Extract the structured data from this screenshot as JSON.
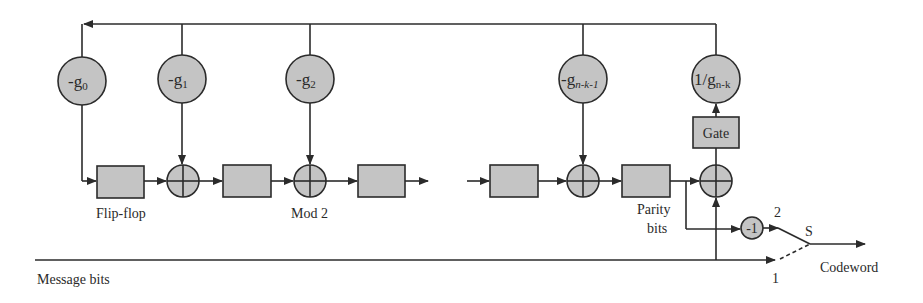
{
  "diagram": {
    "colors": {
      "fill": "#c4c4c4",
      "stroke": "#2b2b2b",
      "background": "#ffffff"
    },
    "coefficients": [
      {
        "id": "g0",
        "prefix": "-g",
        "sub": "0"
      },
      {
        "id": "g1",
        "prefix": "-g",
        "sub": "1"
      },
      {
        "id": "g2",
        "prefix": "-g",
        "sub": "2"
      },
      {
        "id": "gnk1",
        "prefix": "-g",
        "sub": "n-k-1"
      },
      {
        "id": "gnk",
        "prefix": "1/g",
        "sub": "n-k"
      }
    ],
    "gate_label": "Gate",
    "labels": {
      "flip_flop": "Flip-flop",
      "mod2": "Mod 2",
      "parity_line1": "Parity",
      "parity_line2": "bits",
      "message_bits": "Message bits",
      "codeword": "Codeword",
      "switch": "S",
      "switch_pos_1": "1",
      "switch_pos_2": "2",
      "negate": "-1"
    }
  }
}
